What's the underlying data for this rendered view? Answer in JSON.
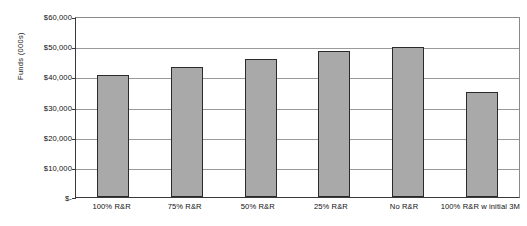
{
  "chart_data": {
    "type": "bar",
    "title": "",
    "subtitle": "",
    "xlabel": "",
    "ylabel": "Funds (000s)",
    "categories": [
      "100% R&R",
      "75% R&R",
      "50% R&R",
      "25% R&R",
      "No R&R",
      "100% R&R w initial 3M"
    ],
    "values": [
      40500,
      43000,
      45800,
      48500,
      49600,
      34700
    ],
    "ylim": [
      0,
      60000
    ],
    "ytick_values": [
      60000,
      50000,
      40000,
      30000,
      20000,
      10000,
      0
    ],
    "ytick_labels": [
      "$60,000",
      "$50,000",
      "$40,000",
      "$30,000",
      "$20,000",
      "$10,000",
      "$-"
    ],
    "grid": true,
    "legend": false,
    "legend_position": "none",
    "bar_color": "#a9a9a9",
    "bar_border_color": "#2b2b2b",
    "gridline_color": "#9a9a9a",
    "axis_color": "#3a3a3a",
    "background_color": "#ffffff",
    "text_color": "#111111"
  }
}
